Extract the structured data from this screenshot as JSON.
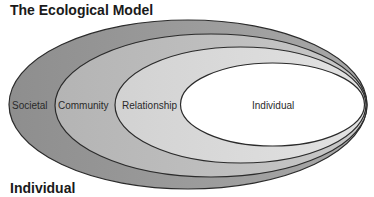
{
  "title": "The Ecological Model",
  "footer": "Individual",
  "levels": [
    {
      "label": "Societal",
      "fill": "#9a9a9a"
    },
    {
      "label": "Community",
      "fill": "#bdbdbd"
    },
    {
      "label": "Relationship",
      "fill": "#d8d8d8"
    },
    {
      "label": "Individual",
      "fill": "#ffffff"
    }
  ],
  "stroke_color": "#2b2b2b"
}
